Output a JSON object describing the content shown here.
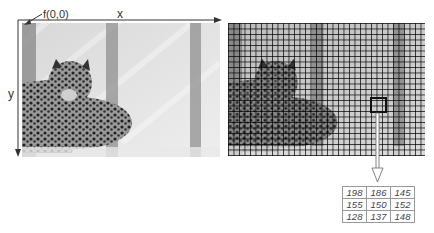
{
  "left_panel": {
    "origin_label": "f(0,0)",
    "x_axis_label": "x",
    "y_axis_label": "y",
    "image_subject": "leopard-grayscale-photo"
  },
  "right_panel": {
    "image_subject": "leopard-grayscale-photo-with-pixel-grid",
    "grid_cell_px": 5.5,
    "highlight_color": "#111111"
  },
  "pixel_values": {
    "rows": [
      [
        "198",
        "186",
        "145"
      ],
      [
        "155",
        "150",
        "152"
      ],
      [
        "128",
        "137",
        "148"
      ]
    ]
  }
}
